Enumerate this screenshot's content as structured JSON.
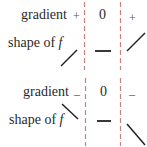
{
  "diagram": {
    "type": "sign-diagram",
    "colors": {
      "divider": "#c98080",
      "line": "#222222",
      "text": "#2a2a2a"
    },
    "panels": [
      {
        "name": "maximum-inflection-increasing",
        "row_labels": {
          "gradient": "gradient",
          "shape_prefix": "shape of ",
          "shape_var": "f"
        },
        "gradient_signs": [
          "+",
          "0",
          "+"
        ],
        "shapes": [
          "rising",
          "flat",
          "rising"
        ]
      },
      {
        "name": "inflection-decreasing",
        "row_labels": {
          "gradient": "gradient",
          "shape_prefix": "shape of ",
          "shape_var": "f"
        },
        "gradient_signs": [
          "–",
          "0",
          "–"
        ],
        "shapes": [
          "falling",
          "flat",
          "falling"
        ]
      }
    ]
  }
}
